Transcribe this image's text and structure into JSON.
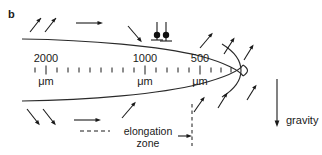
{
  "figure": {
    "panel_letter": "b",
    "background_color": "#ffffff",
    "ink_color": "#1a1a1a"
  },
  "scale": {
    "labels": [
      {
        "value": "2000",
        "unit": "μm",
        "x": 46
      },
      {
        "value": "1000",
        "unit": "μm",
        "x": 145
      },
      {
        "value": "500",
        "unit": "μm",
        "x": 200
      }
    ],
    "tick_axis_y": 70,
    "minor_tick_half": 2.5,
    "major_tick_half": 4.5,
    "tick_start_x": 35,
    "tick_end_x": 238,
    "tick_count": 19,
    "major_tick_x": [
      46,
      145,
      200
    ]
  },
  "annotations": {
    "elongation_zone_line1": "elongation",
    "elongation_zone_line2": "zone",
    "gravity_label": "gravity"
  },
  "arrows": {
    "upper_left_diagonal_up": 2,
    "upper_horizontal": 1,
    "upper_mid_diagonal_down": 1,
    "upper_right_inward": 3,
    "lower_left_diagonal_down": 2,
    "lower_horizontal": 1,
    "lower_mid_diagonal_up": 1,
    "lower_right_inward": 3,
    "tip_arrows": 2,
    "gravity_arrow_direction": "down"
  },
  "markers": {
    "count": 2,
    "description": "surface-marker-pins"
  }
}
